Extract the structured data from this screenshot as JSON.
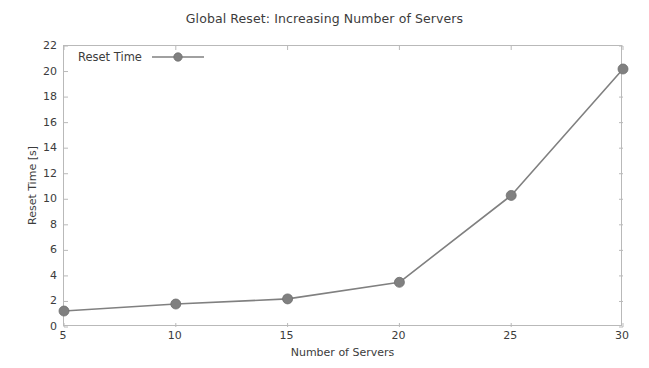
{
  "chart_data": {
    "type": "line",
    "title": "Global Reset: Increasing Number of Servers",
    "xlabel": "Number of Servers",
    "ylabel": "Reset Time [s]",
    "x": [
      5,
      10,
      15,
      20,
      25,
      30
    ],
    "values": [
      1.25,
      1.8,
      2.2,
      3.5,
      10.3,
      20.2
    ],
    "series": [
      {
        "name": "Reset Time",
        "values": [
          1.25,
          1.8,
          2.2,
          3.5,
          10.3,
          20.2
        ]
      }
    ],
    "xlim": [
      5,
      30
    ],
    "ylim": [
      0,
      22
    ],
    "xticks": [
      5,
      10,
      15,
      20,
      25,
      30
    ],
    "yticks": [
      0,
      2,
      4,
      6,
      8,
      10,
      12,
      14,
      16,
      18,
      20,
      22
    ],
    "xtick_labels": [
      "5",
      "10",
      "15",
      "20",
      "25",
      "30"
    ],
    "ytick_labels": [
      "0",
      "2",
      "4",
      "6",
      "8",
      "10",
      "12",
      "14",
      "16",
      "18",
      "20",
      "22"
    ],
    "grid": false,
    "legend": {
      "entries": [
        "Reset Time"
      ],
      "position": "upper left",
      "frame": false
    },
    "marker": "circle",
    "colors": {
      "series": "#808080",
      "frame": "#b9b9b9",
      "text": "#3c3c3c",
      "background": "#ffffff"
    }
  }
}
